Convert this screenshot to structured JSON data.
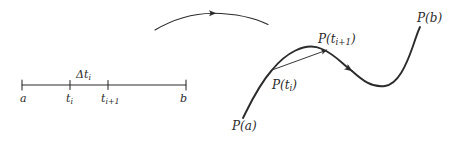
{
  "figure": {
    "type": "math-diagram",
    "background_color": "#ffffff",
    "stroke_color": "#2b2b2b"
  },
  "interval_axis": {
    "name": "parameter-interval",
    "line": {
      "x1": 22,
      "x2": 186,
      "y": 85
    },
    "ticks": [
      {
        "label": "a",
        "x": 22
      },
      {
        "label": "t",
        "sub": "i",
        "x": 70
      },
      {
        "label": "t",
        "sub": "i+1",
        "x": 108
      },
      {
        "label": "b",
        "x": 186
      }
    ],
    "labels": {
      "a": "a",
      "t_i_base": "t",
      "t_i_sub": "i",
      "t_ip1_base": "t",
      "t_ip1_sub": "i+1",
      "b": "b"
    },
    "delta_label": {
      "symbol": "Δt",
      "subscript": "i",
      "full": "Δtᵢ"
    }
  },
  "direction_arc": {
    "name": "orientation-arrow",
    "description": "arc with midpoint arrowhead indicating direction of travel"
  },
  "curve": {
    "name": "parametric-curve",
    "description": "S-shaped curve from P(a) to P(b)",
    "arrow_on_curve": true
  },
  "secant": {
    "name": "secant-vector",
    "from": "P(t_i)",
    "to": "P(t_i+1)"
  },
  "point_labels": {
    "p_a": {
      "base": "P(a)",
      "prefix": "P(",
      "var": "a",
      "suffix": ")"
    },
    "p_b": {
      "base": "P(b)",
      "prefix": "P(",
      "var": "b",
      "suffix": ")"
    },
    "p_ti": {
      "prefix": "P(",
      "var": "t",
      "sub": "i",
      "suffix": ")"
    },
    "p_tip1": {
      "prefix": "P(",
      "var": "t",
      "sub": "i+1",
      "suffix": ")"
    }
  },
  "colors": {
    "ink": "#2b2b2b",
    "paper": "#ffffff"
  }
}
